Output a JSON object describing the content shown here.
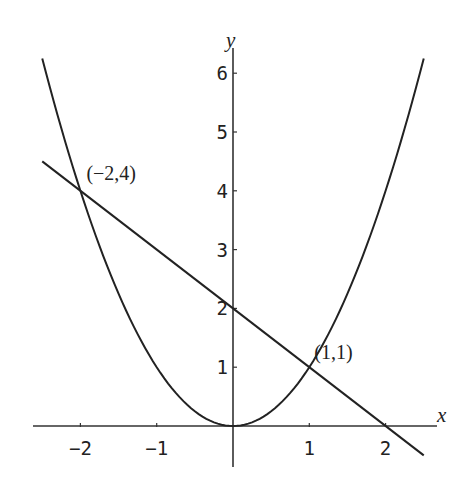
{
  "chart_data": {
    "type": "line",
    "title": "",
    "xlabel": "x",
    "ylabel": "y",
    "xlim": [
      -2.6,
      2.7
    ],
    "ylim": [
      -0.7,
      6.5
    ],
    "grid": false,
    "legend": "none",
    "x_ticks": [
      -2,
      -1,
      1,
      2
    ],
    "x_tick_labels": [
      "-2",
      "-1",
      "1",
      "2"
    ],
    "y_ticks": [
      1,
      2,
      3,
      4,
      5,
      6
    ],
    "y_tick_labels": [
      "1",
      "2",
      "3",
      "4",
      "5",
      "6"
    ],
    "series": [
      {
        "name": "parabola",
        "equation": "y = x^2",
        "x_range": [
          -2.5,
          2.5
        ],
        "x": [
          -2.5,
          -2.0,
          -1.5,
          -1.0,
          -0.5,
          0.0,
          0.5,
          1.0,
          1.5,
          2.0,
          2.5
        ],
        "y": [
          6.25,
          4.0,
          2.25,
          1.0,
          0.25,
          0.0,
          0.25,
          1.0,
          2.25,
          4.0,
          6.25
        ]
      },
      {
        "name": "line",
        "equation": "y = 2 - x",
        "x_range": [
          -2.5,
          2.5
        ],
        "x": [
          -2.5,
          2.5
        ],
        "y": [
          4.5,
          -0.5
        ]
      }
    ],
    "annotations": [
      {
        "text": "(−2,4)",
        "x": -2,
        "y": 4
      },
      {
        "text": "(1,1)",
        "x": 1,
        "y": 1
      }
    ]
  }
}
